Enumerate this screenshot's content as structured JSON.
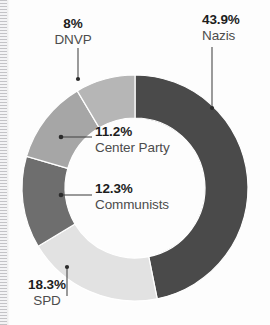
{
  "chart_data": {
    "type": "pie",
    "variant": "donut",
    "title": "",
    "subtitle": "",
    "xlabel": "",
    "ylabel": "",
    "legend_position": "none",
    "grid": false,
    "start_angle_deg": 0,
    "direction": "clockwise",
    "units": "percent",
    "categories": [
      "Nazis",
      "SPD",
      "Communists",
      "Center Party",
      "DNVP"
    ],
    "values": [
      43.9,
      18.3,
      12.3,
      11.2,
      8.0
    ],
    "colors": [
      "#4a4a4a",
      "#e2e2e2",
      "#6e6e6e",
      "#a6a6a6",
      "#b6b6b6"
    ],
    "slices": [
      {
        "label": "Nazis",
        "value": 43.9,
        "value_text": "43.9%",
        "color": "#4a4a4a",
        "label_placement": "outside-top-right"
      },
      {
        "label": "SPD",
        "value": 18.3,
        "value_text": "18.3%",
        "color": "#e2e2e2",
        "label_placement": "outside-bottom-left"
      },
      {
        "label": "Communists",
        "value": 12.3,
        "value_text": "12.3%",
        "color": "#6e6e6e",
        "label_placement": "inside-center"
      },
      {
        "label": "Center Party",
        "value": 11.2,
        "value_text": "11.2%",
        "color": "#a6a6a6",
        "label_placement": "inside-center"
      },
      {
        "label": "DNVP",
        "value": 8.0,
        "value_text": "8%",
        "color": "#b6b6b6",
        "label_placement": "outside-top-left"
      }
    ]
  },
  "labels": {
    "nazis": {
      "pct": "43.9%",
      "name": "Nazis"
    },
    "spd": {
      "pct": "18.3%",
      "name": "SPD"
    },
    "communists": {
      "pct": "12.3%",
      "name": "Communists"
    },
    "center_party": {
      "pct": "11.2%",
      "name": "Center Party"
    },
    "dnvp": {
      "pct": "8%",
      "name": "DNVP"
    }
  },
  "style": {
    "background": "#ffffff",
    "separator_color": "#ffffff",
    "leader_line_color": "#4a4a4a",
    "pct_text_color": "#1d1d1d",
    "name_text_color": "#4c4c4c"
  }
}
